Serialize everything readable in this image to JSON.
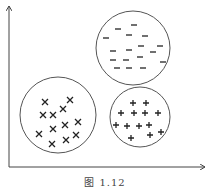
{
  "caption": "图  1.12",
  "colors": {
    "ink": "#222222",
    "circle": "#555555"
  },
  "axes": {
    "origin": [
      9,
      167
    ],
    "y_top": 5,
    "x_right": 206
  },
  "clusters": [
    {
      "name": "minus-cluster",
      "symbol": "−",
      "circle": {
        "cx": 133,
        "cy": 48,
        "r": 37
      },
      "points": [
        [
          118,
          29
        ],
        [
          134,
          25
        ],
        [
          106,
          38
        ],
        [
          129,
          35
        ],
        [
          145,
          36
        ],
        [
          113,
          51
        ],
        [
          129,
          50
        ],
        [
          141,
          46
        ],
        [
          160,
          46
        ],
        [
          113,
          60
        ],
        [
          126,
          60
        ],
        [
          140,
          57
        ],
        [
          153,
          52
        ],
        [
          163,
          62
        ],
        [
          117,
          68
        ],
        [
          129,
          68
        ],
        [
          143,
          68
        ]
      ]
    },
    {
      "name": "x-cluster",
      "symbol": "×",
      "circle": {
        "cx": 58,
        "cy": 115,
        "r": 38
      },
      "points": [
        [
          45,
          102
        ],
        [
          70,
          100
        ],
        [
          43,
          115
        ],
        [
          53,
          115
        ],
        [
          63,
          109
        ],
        [
          78,
          122
        ],
        [
          53,
          129
        ],
        [
          65,
          125
        ],
        [
          39,
          134
        ],
        [
          52,
          144
        ],
        [
          66,
          140
        ],
        [
          76,
          135
        ]
      ]
    },
    {
      "name": "plus-cluster",
      "symbol": "+",
      "circle": {
        "cx": 140,
        "cy": 117,
        "r": 30
      },
      "points": [
        [
          133,
          103
        ],
        [
          146,
          103
        ],
        [
          121,
          113
        ],
        [
          134,
          113
        ],
        [
          145,
          113
        ],
        [
          158,
          113
        ],
        [
          116,
          125
        ],
        [
          127,
          126
        ],
        [
          139,
          126
        ],
        [
          149,
          125
        ],
        [
          131,
          138
        ],
        [
          150,
          135
        ],
        [
          161,
          132
        ]
      ]
    }
  ]
}
